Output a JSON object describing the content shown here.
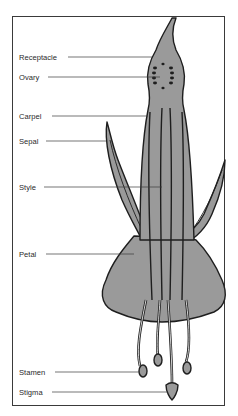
{
  "diagram": {
    "colors": {
      "fill": "#9a9a9a",
      "outline": "#1e1e1e",
      "leader": "#3a3a3a",
      "background": "#ffffff"
    },
    "labels": [
      {
        "id": "receptacle",
        "text": "Receptacle",
        "y": 57,
        "line_start": 68,
        "line_end": 152
      },
      {
        "id": "ovary",
        "text": "Ovary",
        "y": 77,
        "line_start": 48,
        "line_end": 160
      },
      {
        "id": "carpel",
        "text": "Carpel",
        "y": 116,
        "line_start": 52,
        "line_end": 148
      },
      {
        "id": "sepal",
        "text": "Sepal",
        "y": 141,
        "line_start": 46,
        "line_end": 106
      },
      {
        "id": "style",
        "text": "Style",
        "y": 187,
        "line_start": 44,
        "line_end": 162
      },
      {
        "id": "petal",
        "text": "Petal",
        "y": 254,
        "line_start": 46,
        "line_end": 134
      },
      {
        "id": "stamen",
        "text": "Stamen",
        "y": 372,
        "line_start": 55,
        "line_end": 140
      },
      {
        "id": "stigma",
        "text": "Stigma",
        "y": 392,
        "line_start": 52,
        "line_end": 168
      }
    ]
  }
}
